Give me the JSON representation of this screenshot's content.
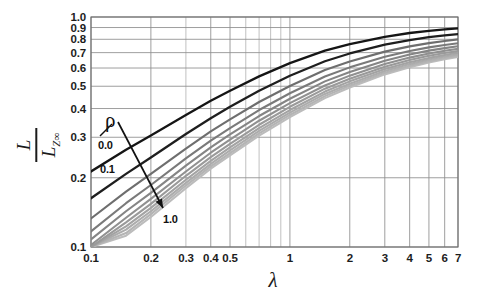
{
  "figure": {
    "background_color": "#ffffff",
    "plot_area": {
      "left": 91,
      "top": 17,
      "right": 458,
      "bottom": 247
    }
  },
  "axes": {
    "x": {
      "label": "λ",
      "scale": "log",
      "min": 0.1,
      "max": 7.0,
      "tick_labels": [
        "0.1",
        "0.2",
        "0.3",
        "0.4",
        "0.5",
        "1",
        "2",
        "3",
        "4",
        "5",
        "6",
        "7"
      ],
      "tick_values": [
        0.1,
        0.2,
        0.3,
        0.4,
        0.5,
        1,
        2,
        3,
        4,
        5,
        6,
        7
      ],
      "minor_tick_values": [
        0.6,
        0.7,
        0.8,
        0.9
      ]
    },
    "y": {
      "label_numerator": "L",
      "label_denominator": "L",
      "label_denominator_subscript": "Z∞",
      "scale": "log",
      "min": 0.1,
      "max": 1.0,
      "tick_labels": [
        "0.1",
        "0.2",
        "0.3",
        "0.4",
        "0.5",
        "0.6",
        "0.7",
        "0.8",
        "0.9",
        "1.0"
      ],
      "tick_values": [
        0.1,
        0.2,
        0.3,
        0.4,
        0.5,
        0.6,
        0.7,
        0.8,
        0.9,
        1.0
      ]
    }
  },
  "annotations": {
    "parameter_symbol": "ρ",
    "first_curve_label": "0.0",
    "second_curve_label": "0.1",
    "last_curve_label": "1.0",
    "arrow_from": [
      118,
      122
    ],
    "arrow_to": [
      163,
      208
    ]
  },
  "colors": {
    "grid": "#8d8d8d",
    "axis": "#555555",
    "curve_dark": "#151515",
    "curve_light": "#b4b4b4",
    "text": "#1b1b1b"
  },
  "chart_data": {
    "type": "line",
    "title": "",
    "xlabel": "λ",
    "ylabel": "L / L_Z∞",
    "xscale": "log",
    "yscale": "log",
    "xlim": [
      0.1,
      7.0
    ],
    "ylim": [
      0.1,
      1.0
    ],
    "grid": true,
    "legend": "none",
    "annotation": "ρ increases from 0.0 (top curve, dark) to 1.0 (bottom curve, light) along the arrow",
    "x": [
      0.1,
      0.15,
      0.2,
      0.3,
      0.4,
      0.5,
      0.7,
      1.0,
      1.5,
      2.0,
      3.0,
      4.0,
      5.0,
      6.0,
      7.0
    ],
    "series": [
      {
        "name": "ρ = 0.0",
        "color": "#151515",
        "width": 2.3,
        "values": [
          0.213,
          0.265,
          0.305,
          0.375,
          0.432,
          0.478,
          0.552,
          0.63,
          0.714,
          0.762,
          0.82,
          0.852,
          0.871,
          0.884,
          0.893
        ]
      },
      {
        "name": "ρ = 0.1",
        "color": "#1e1e1e",
        "width": 2.3,
        "values": [
          0.163,
          0.208,
          0.245,
          0.31,
          0.363,
          0.407,
          0.478,
          0.555,
          0.642,
          0.694,
          0.758,
          0.794,
          0.817,
          0.832,
          0.843
        ]
      },
      {
        "name": "ρ = 0.2",
        "color": "#6e6e6e",
        "width": 2.1,
        "values": [
          0.133,
          0.174,
          0.208,
          0.268,
          0.318,
          0.359,
          0.427,
          0.501,
          0.588,
          0.64,
          0.707,
          0.745,
          0.77,
          0.787,
          0.799
        ]
      },
      {
        "name": "ρ = 0.3",
        "color": "#7a7a7a",
        "width": 2.1,
        "values": [
          0.117,
          0.155,
          0.186,
          0.243,
          0.29,
          0.329,
          0.394,
          0.466,
          0.551,
          0.604,
          0.672,
          0.712,
          0.738,
          0.756,
          0.769
        ]
      },
      {
        "name": "ρ = 0.4",
        "color": "#858585",
        "width": 2.1,
        "values": [
          0.108,
          0.143,
          0.172,
          0.226,
          0.271,
          0.309,
          0.371,
          0.441,
          0.525,
          0.577,
          0.646,
          0.687,
          0.714,
          0.732,
          0.746
        ]
      },
      {
        "name": "ρ = 0.5",
        "color": "#909090",
        "width": 2.1,
        "values": [
          0.102,
          0.134,
          0.162,
          0.213,
          0.257,
          0.293,
          0.354,
          0.422,
          0.504,
          0.556,
          0.625,
          0.666,
          0.694,
          0.713,
          0.727
        ]
      },
      {
        "name": "ρ = 0.6",
        "color": "#9a9a9a",
        "width": 2.1,
        "values": [
          0.1,
          0.128,
          0.154,
          0.204,
          0.246,
          0.281,
          0.34,
          0.407,
          0.488,
          0.539,
          0.608,
          0.65,
          0.678,
          0.697,
          0.712
        ]
      },
      {
        "name": "ρ = 0.7",
        "color": "#a3a3a3",
        "width": 2.1,
        "values": [
          0.1,
          0.123,
          0.148,
          0.196,
          0.237,
          0.271,
          0.329,
          0.394,
          0.474,
          0.525,
          0.594,
          0.636,
          0.664,
          0.684,
          0.699
        ]
      },
      {
        "name": "ρ = 0.8",
        "color": "#acacac",
        "width": 2.1,
        "values": [
          0.1,
          0.119,
          0.143,
          0.19,
          0.23,
          0.263,
          0.32,
          0.384,
          0.463,
          0.513,
          0.582,
          0.624,
          0.653,
          0.673,
          0.688
        ]
      },
      {
        "name": "ρ = 0.9",
        "color": "#b4b4b4",
        "width": 2.1,
        "values": [
          0.1,
          0.115,
          0.139,
          0.185,
          0.224,
          0.256,
          0.312,
          0.375,
          0.453,
          0.503,
          0.572,
          0.614,
          0.643,
          0.663,
          0.678
        ]
      },
      {
        "name": "ρ = 1.0",
        "color": "#bcbcbc",
        "width": 2.1,
        "values": [
          0.1,
          0.112,
          0.135,
          0.18,
          0.219,
          0.25,
          0.305,
          0.367,
          0.444,
          0.494,
          0.563,
          0.605,
          0.634,
          0.655,
          0.67
        ]
      }
    ]
  }
}
